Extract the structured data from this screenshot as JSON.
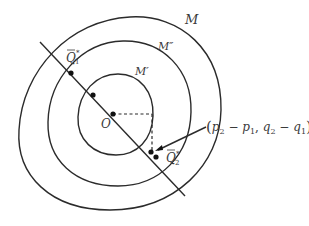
{
  "diagram": {
    "curves": [
      {
        "label": "M",
        "role": "outer"
      },
      {
        "label": "M″",
        "role": "middle"
      },
      {
        "label": "M′",
        "role": "inner"
      }
    ],
    "points": {
      "origin": "O",
      "q1": {
        "letter": "Q",
        "sub": "1",
        "sup": "*"
      },
      "q2": {
        "letter": "Q",
        "sub": "2",
        "sup": "*"
      }
    },
    "annotation": {
      "open": "(",
      "p2": "p",
      "p2_sub": "2",
      "minus1": " − ",
      "p1": "p",
      "p1_sub": "1",
      "comma": ", ",
      "q2": "q",
      "q2_sub": "2",
      "minus2": " − ",
      "q1": "q",
      "q1_sub": "1",
      "close": ")"
    }
  }
}
